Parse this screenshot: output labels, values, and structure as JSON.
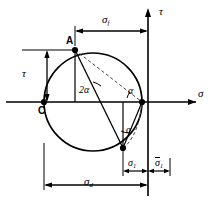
{
  "figure": {
    "name": "mohr-circle-diagram",
    "type": "engineering-diagram",
    "stroke_color": "#000000",
    "background_color": "#ffffff",
    "dashed_color": "#555555"
  },
  "axes": {
    "horizontal_label": "σ",
    "vertical_label": "τ"
  },
  "points": {
    "center_label": "C",
    "upper_left_label": "A"
  },
  "angles": {
    "central": "2α",
    "inscribed_right": "α",
    "inscribed_lower": "α"
  },
  "dimensions": {
    "top_label_base": "σ",
    "top_label_sub": "f",
    "left_label": "τ",
    "bottom_label_base": "σ",
    "bottom_label_sub": "d",
    "sigma1_base": "σ",
    "sigma1_sub": "1",
    "sigma1_bar_base": "σ",
    "sigma1_bar_sub": "1"
  },
  "geometry": {
    "circle_center_x": 93,
    "circle_center_y": 102,
    "circle_radius": 49,
    "point_a_x": 75,
    "point_a_y": 50,
    "point_c_x": 44,
    "point_c_y": 102,
    "point_right_x": 142,
    "point_right_y": 102,
    "point_bottom_x": 123,
    "point_bottom_y": 148,
    "tau_axis_x": 148,
    "sigma_axis_y": 102
  }
}
